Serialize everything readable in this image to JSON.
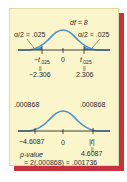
{
  "colors": {
    "panel_bg": "#fbf5cc",
    "shadow": "#c8323f",
    "curve": "#4a8fcf",
    "tail_fill": "#4a8fcf",
    "text": "#2a2a2a"
  },
  "top_diagram": {
    "df_label": "df = 8",
    "left_tail_label": "α/2 = .025",
    "right_tail_label": "α/2 = .025",
    "center_tick": "0",
    "left_critical": "−t.025",
    "left_critical_sub": ".025",
    "right_critical": "t.025",
    "equals_sign": "||",
    "left_value": "−2.306",
    "right_value": "2.306"
  },
  "bottom_diagram": {
    "left_tail_label": ".000868",
    "right_tail_label": ".000868",
    "left_value": "−4.6087",
    "center_tick": "0",
    "right_label": "|t|",
    "equals_sign": "||",
    "right_value": "4.6087",
    "pvalue_label": "p-value",
    "pvalue_expr": "= 2(.000868) = .001736"
  }
}
